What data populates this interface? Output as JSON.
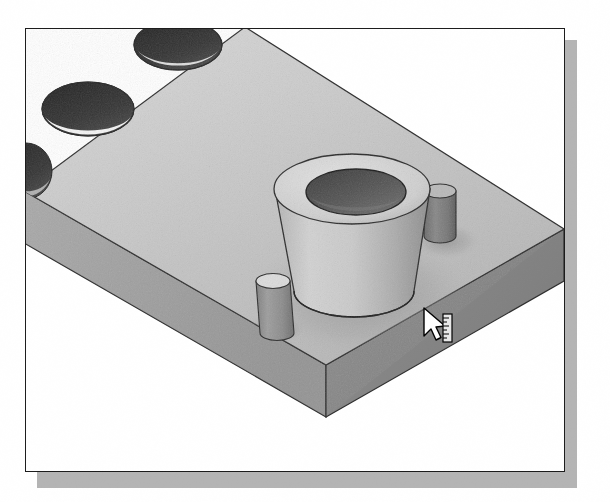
{
  "document": {
    "title": "3D Isometric Part View",
    "view_type": "isometric",
    "render_style": "shaded-grayscale-halftone"
  },
  "viewport": {
    "background_color": "#ffffff",
    "border_color": "#1c1c1c",
    "shadow_color": "#b4b4b4"
  },
  "model": {
    "name": "rectangular-base-plate",
    "description": "Rectangular plate shown in isometric projection with through holes, a tapered hollow boss and two small cylindrical pins",
    "colors": {
      "top_face": "#c9c9c9",
      "front_face": "#9a9a9a",
      "right_face": "#8a8a8a",
      "edge_line": "#2a2a2a",
      "hole_dark": "#3a3a3a",
      "hole_bottom": "#f2f2f2",
      "boss_light": "#cccccc",
      "boss_shade": "#a6a6a6",
      "boss_bore": "#5a5a5a",
      "pin_body": "#8f8f8f",
      "pin_top": "#d8d8d8"
    },
    "features": [
      {
        "id": "hole-top",
        "label": "through-hole top",
        "type": "hole",
        "cx": 152,
        "cy": 18,
        "rx": 42,
        "ry": 24
      },
      {
        "id": "hole-left",
        "label": "through-hole left",
        "type": "hole",
        "cx": 62,
        "cy": 80,
        "rx": 44,
        "ry": 26
      },
      {
        "id": "hole-edge",
        "label": "through-hole edge (clipped)",
        "type": "hole",
        "cx": 2,
        "cy": 140,
        "rx": 24,
        "ry": 26
      },
      {
        "id": "boss-center",
        "label": "tapered hollow boss",
        "type": "boss",
        "cx": 326,
        "cy": 185
      },
      {
        "id": "pin-right",
        "label": "cylindrical pin right",
        "type": "pin",
        "cx": 412,
        "cy": 200
      },
      {
        "id": "pin-front",
        "label": "cylindrical pin front",
        "type": "pin",
        "cx": 243,
        "cy": 295
      }
    ]
  },
  "cursor": {
    "name": "measure-tool-pointer",
    "label": "Arrow pointer with ruler / measurement badge",
    "x": 424,
    "y": 308,
    "arrow_fill": "#ffffff",
    "arrow_stroke": "#000000",
    "badge_fill": "#e8e8e8",
    "badge_stroke": "#000000"
  }
}
